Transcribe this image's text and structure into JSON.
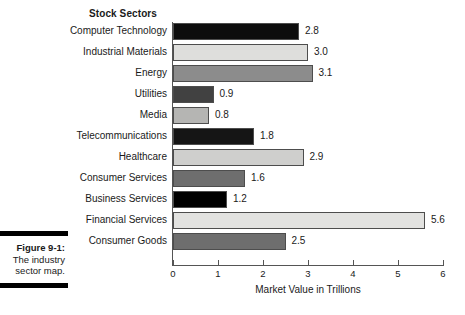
{
  "caption": {
    "label": "Figure 9-1:",
    "line1": "The industry",
    "line2": "sector map."
  },
  "chart_data": {
    "type": "bar",
    "orientation": "horizontal",
    "title": "Stock Sectors",
    "xlabel": "Market Value in Trillions",
    "ylabel": "",
    "xlim": [
      0,
      6
    ],
    "xticks": [
      "0",
      "1",
      "2",
      "3",
      "4",
      "5",
      "6"
    ],
    "grid": false,
    "legend": null,
    "categories": [
      "Computer Technology",
      "Industrial Materials",
      "Energy",
      "Utilities",
      "Media",
      "Telecommunications",
      "Healthcare",
      "Consumer Services",
      "Business Services",
      "Financial Services",
      "Consumer Goods"
    ],
    "values": [
      2.8,
      3.0,
      3.1,
      0.9,
      0.8,
      1.8,
      2.9,
      1.6,
      1.2,
      5.6,
      2.5
    ],
    "value_labels": [
      "2.8",
      "3.0",
      "3.1",
      "0.9",
      "0.8",
      "1.8",
      "2.9",
      "1.6",
      "1.2",
      "5.6",
      "2.5"
    ],
    "bar_colors": [
      "#0d0d0d",
      "#dededc",
      "#8c8c8c",
      "#414141",
      "#b5b5b3",
      "#151515",
      "#cfcfcd",
      "#6e6e6e",
      "#000000",
      "#e2e2e0",
      "#6e6e6e"
    ]
  }
}
